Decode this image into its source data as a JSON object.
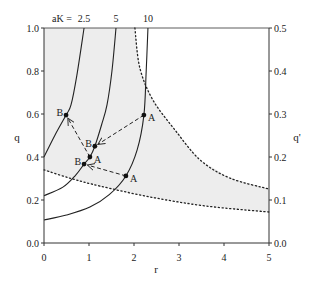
{
  "chart_data": {
    "type": "line",
    "title": "",
    "xlabel": "r",
    "ylabel": "q",
    "ylabel_right": "q'",
    "xlim": [
      0,
      5
    ],
    "ylim": [
      0,
      1.0
    ],
    "ylim_right": [
      0,
      0.5
    ],
    "grid": false,
    "x_ticks": [
      "0",
      "1",
      "2",
      "3",
      "4",
      "5"
    ],
    "y_ticks": [
      "0.0",
      "0.2",
      "0.4",
      "0.6",
      "0.8",
      "1.0"
    ],
    "y_ticks_right": [
      "0.0",
      "0.1",
      "0.2",
      "0.3",
      "0.4",
      "0.5"
    ],
    "series_header": "aK =",
    "series": [
      {
        "name": "2.5",
        "style": "solid",
        "points": [
          [
            0,
            0.4
          ],
          [
            0.24,
            0.5
          ],
          [
            0.49,
            0.595
          ],
          [
            0.6,
            0.642
          ],
          [
            0.73,
            0.78
          ],
          [
            0.89,
            1.0
          ]
        ]
      },
      {
        "name": "5",
        "style": "solid",
        "points": [
          [
            0,
            0.22
          ],
          [
            0.42,
            0.26
          ],
          [
            0.7,
            0.315
          ],
          [
            0.89,
            0.367
          ],
          [
            1.02,
            0.4
          ],
          [
            1.13,
            0.45
          ],
          [
            1.28,
            0.55
          ],
          [
            1.4,
            0.642
          ],
          [
            1.51,
            0.8
          ],
          [
            1.6,
            1.0
          ]
        ]
      },
      {
        "name": "10",
        "style": "solid",
        "points": [
          [
            0,
            0.107
          ],
          [
            0.5,
            0.13
          ],
          [
            1.02,
            0.167
          ],
          [
            1.45,
            0.225
          ],
          [
            1.82,
            0.312
          ],
          [
            2.07,
            0.433
          ],
          [
            2.22,
            0.595
          ],
          [
            2.27,
            0.795
          ],
          [
            2.31,
            1.0
          ]
        ]
      }
    ],
    "boundaries": [
      {
        "name": "upper-boundary",
        "style": "dotted",
        "points": [
          [
            2.02,
            1.0
          ],
          [
            2.13,
            0.814
          ],
          [
            2.42,
            0.665
          ],
          [
            2.91,
            0.526
          ],
          [
            3.47,
            0.386
          ],
          [
            4.13,
            0.302
          ],
          [
            5.0,
            0.251
          ]
        ]
      },
      {
        "name": "lower-boundary",
        "style": "dotted",
        "points": [
          [
            0,
            0.34
          ],
          [
            0.6,
            0.3
          ],
          [
            1.24,
            0.265
          ],
          [
            2.36,
            0.214
          ],
          [
            3.6,
            0.172
          ],
          [
            5.0,
            0.144
          ]
        ]
      }
    ],
    "shaded_region": {
      "color": "#ededed",
      "description": "region between lower and upper dotted boundaries"
    },
    "points": [
      {
        "label": "B",
        "x": 0.49,
        "y": 0.595,
        "label_side": "left"
      },
      {
        "label": "A",
        "x": 2.22,
        "y": 0.595,
        "label_side": "right"
      },
      {
        "label": "B",
        "x": 1.13,
        "y": 0.45,
        "label_side": "left"
      },
      {
        "label": "A",
        "x": 1.02,
        "y": 0.4,
        "label_side": "right"
      },
      {
        "label": "B",
        "x": 0.89,
        "y": 0.367,
        "label_side": "left"
      },
      {
        "label": "A",
        "x": 1.82,
        "y": 0.312,
        "label_side": "right"
      }
    ],
    "arrows": [
      {
        "from": [
          2.22,
          0.595
        ],
        "to": [
          1.13,
          0.45
        ],
        "style": "dashed"
      },
      {
        "from": [
          1.02,
          0.4
        ],
        "to": [
          0.49,
          0.595
        ],
        "style": "dashed"
      },
      {
        "from": [
          1.82,
          0.312
        ],
        "to": [
          0.89,
          0.367
        ],
        "style": "dashed"
      }
    ],
    "colors": {
      "line": "#222222",
      "shade": "#ededed",
      "axis": "#333333"
    }
  }
}
